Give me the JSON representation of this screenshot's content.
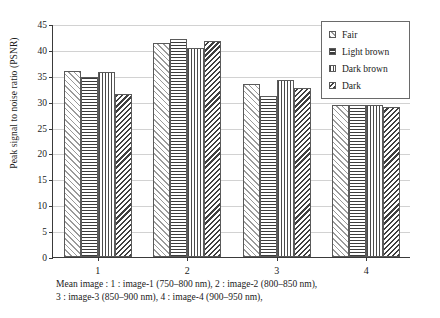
{
  "chart_data": {
    "type": "bar",
    "title": "",
    "xlabel": "Mean image",
    "ylabel": "Peak signal to noise ratio (PSNR)",
    "categories": [
      "1",
      "2",
      "3",
      "4"
    ],
    "ylim": [
      0,
      45
    ],
    "yticks": [
      0,
      5,
      10,
      15,
      20,
      25,
      30,
      35,
      40,
      45
    ],
    "grid": true,
    "legend_position": "top-right",
    "series": [
      {
        "name": "Fair",
        "pattern": "diagonal-up",
        "values": [
          35.9,
          41.4,
          33.4,
          29.3
        ]
      },
      {
        "name": "Light brown",
        "pattern": "horizontal",
        "values": [
          34.8,
          42.2,
          31.1,
          29.4
        ]
      },
      {
        "name": "Dark brown",
        "pattern": "vertical",
        "values": [
          35.7,
          40.3,
          34.1,
          29.4
        ]
      },
      {
        "name": "Dark",
        "pattern": "diagonal-down",
        "values": [
          31.5,
          41.7,
          32.6,
          28.9
        ]
      }
    ]
  },
  "caption": {
    "line1": "Mean image : 1 : image-1 (750–800 nm), 2 : image-2 (800–850 nm),",
    "line2": "3 : image-3 (850–900 nm), 4 : image-4 (900–950 nm),"
  }
}
